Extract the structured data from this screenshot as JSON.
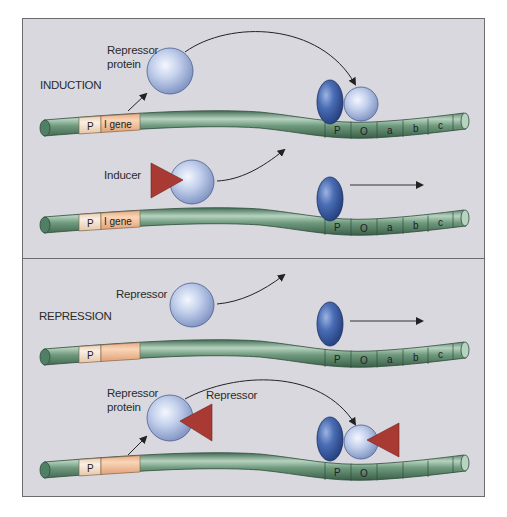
{
  "figure": {
    "colors": {
      "background": "#d9d8df",
      "border": "#6b6b70",
      "dna_green": "#5f8b6f",
      "dna_green_light": "#9cc0a6",
      "promoter_tan": "#f6e2cf",
      "igene_orange": "#f2c39e",
      "repressor_sphere": "#b3c3e3",
      "rna_polymerase": "#3d5fa3",
      "inducer_triangle": "#a83a33",
      "arrow": "#222222"
    }
  },
  "sections": [
    {
      "title": "INDUCTION",
      "rows": [
        {
          "labels": {
            "repressor": "Repressor",
            "protein": "protein"
          },
          "dna_segments_left": [
            "P",
            "I gene"
          ],
          "dna_segments_right": [
            "P",
            "O",
            "a",
            "b",
            "c"
          ],
          "state": "repressor bound to operator; polymerase blocked"
        },
        {
          "labels": {
            "inducer": "Inducer"
          },
          "dna_segments_left": [
            "P",
            "I gene"
          ],
          "dna_segments_right": [
            "P",
            "O",
            "a",
            "b",
            "c"
          ],
          "state": "inducer binds repressor; polymerase transcribes"
        }
      ]
    },
    {
      "title": "REPRESSION",
      "rows": [
        {
          "labels": {
            "repressor": "Repressor"
          },
          "dna_segments_left": [
            "P",
            ""
          ],
          "dna_segments_right": [
            "P",
            "O",
            "a",
            "b",
            "c"
          ],
          "state": "inactive repressor; polymerase transcribes"
        },
        {
          "labels": {
            "repressor": "Repressor",
            "protein": "protein",
            "corepressor": "Repressor"
          },
          "dna_segments_left": [
            "P",
            ""
          ],
          "dna_segments_right": [
            "P",
            "O",
            "",
            "",
            ""
          ],
          "state": "corepressor-repressor complex bound to operator; polymerase blocked"
        }
      ]
    }
  ]
}
